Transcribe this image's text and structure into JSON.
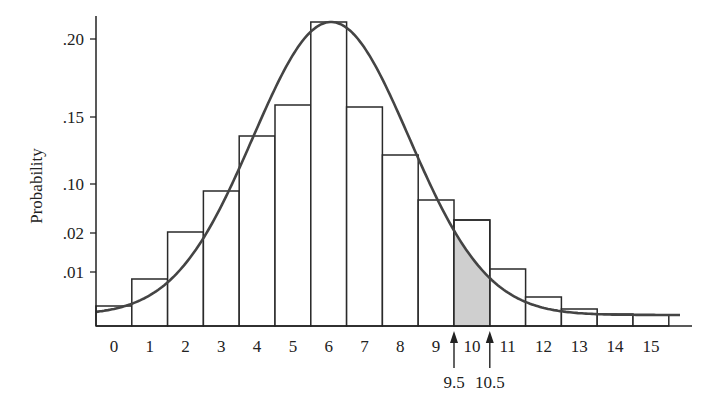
{
  "chart_data": {
    "type": "bar",
    "title": "",
    "xlabel": "",
    "ylabel": "Probability",
    "categories": [
      "0",
      "1",
      "2",
      "3",
      "4",
      "5",
      "6",
      "7",
      "8",
      "9",
      "10",
      "11",
      "12",
      "13",
      "14",
      "15"
    ],
    "values": [
      0.003,
      0.007,
      0.014,
      0.024,
      0.13,
      0.154,
      0.205,
      0.153,
      0.118,
      0.022,
      0.018,
      0.009,
      0.004,
      0.002,
      0.001,
      0.001
    ],
    "series": [
      {
        "name": "Binomial probabilities (histogram)",
        "type": "bar"
      },
      {
        "name": "Normal approximation curve",
        "type": "line"
      }
    ],
    "y_ticks": [
      ".20",
      ".15",
      ".10",
      ".02",
      ".01"
    ],
    "x_ticks": [
      "0",
      "1",
      "2",
      "3",
      "4",
      "5",
      "6",
      "7",
      "8",
      "9",
      "10",
      "11",
      "12",
      "13",
      "14",
      "15"
    ],
    "shaded_region": {
      "from": 9.5,
      "to": 10.5,
      "color": "#cfcfcf"
    },
    "annotations": [
      {
        "label": "9.5",
        "x": 9.5,
        "type": "arrow"
      },
      {
        "label": "10.5",
        "x": 10.5,
        "type": "arrow"
      }
    ],
    "grid": false,
    "legend": "none"
  },
  "colors": {
    "curve": "#444444",
    "bar_stroke": "#2a2a2a",
    "shade": "#cfcfcf",
    "axis": "#222222"
  }
}
